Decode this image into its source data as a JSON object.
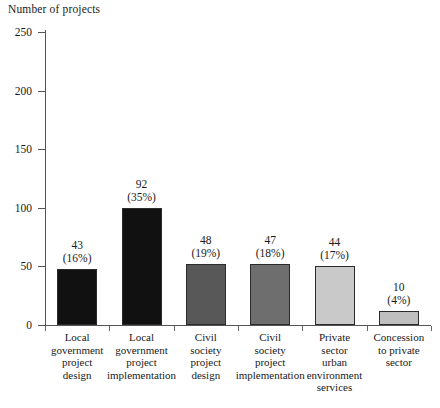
{
  "chart_data": {
    "type": "bar",
    "title": "Number of projects",
    "xlabel": "",
    "ylabel": "Number of projects",
    "ylim": [
      0,
      250
    ],
    "yticks": [
      0,
      50,
      100,
      150,
      200,
      250
    ],
    "grid": false,
    "legend": "none",
    "categories": [
      "Local government project design",
      "Local government project implementation",
      "Civil society project design",
      "Civil society project implementation",
      "Private sector urban environment services",
      "Concession to private sector"
    ],
    "category_lines": [
      [
        "Local",
        "government",
        "project",
        "design"
      ],
      [
        "Local",
        "government",
        "project",
        "implementation"
      ],
      [
        "Civil",
        "society",
        "project",
        "design"
      ],
      [
        "Civil",
        "society",
        "project",
        "implementation"
      ],
      [
        "Private",
        "sector",
        "urban",
        "environment",
        "services"
      ],
      [
        "Concession",
        "to private",
        "sector"
      ]
    ],
    "values": [
      43,
      92,
      48,
      47,
      44,
      10
    ],
    "percents": [
      "(16%)",
      "(35%)",
      "(19%)",
      "(18%)",
      "(17%)",
      "(4%)"
    ],
    "value_labels": [
      "43",
      "92",
      "48",
      "47",
      "44",
      "10"
    ],
    "bar_colors": [
      "#111111",
      "#111111",
      "#585858",
      "#6e6e6e",
      "#c9c9c9",
      "#bfbfbf"
    ],
    "bar_edge_color": "#2b2b2b",
    "axis_color": "#555555",
    "text_color": "#1a1a1a"
  },
  "axis": {
    "y_tick_labels": [
      "250",
      "200",
      "150",
      "100",
      "50",
      "0"
    ]
  }
}
